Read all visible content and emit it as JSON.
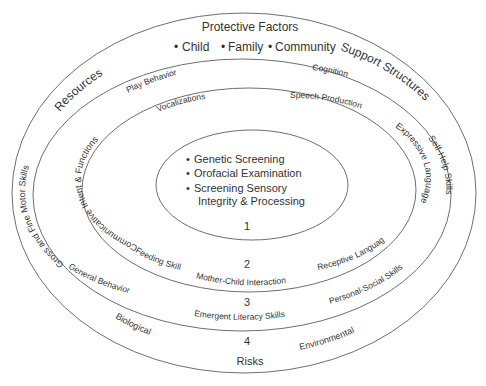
{
  "diagram": {
    "title": "Protective Factors",
    "protective_factors": [
      "Child",
      "Family",
      "Community"
    ],
    "outer_labels": {
      "top_left": "Resources",
      "top_right": "Support Structures",
      "bottom_center": "Risks",
      "bottom_left": "Biological",
      "bottom_right": "Environmental"
    },
    "ring_numbers": [
      "1",
      "2",
      "3",
      "4"
    ],
    "core": {
      "items": [
        "Genetic Screening",
        "Orofacial Examination",
        "Screening Sensory",
        "Integrity & Processing"
      ]
    },
    "ring3_band": {
      "top_left": "Play Behavior",
      "top_right": "Cognition",
      "left": "Gross and Fine Motor Skills",
      "right": "Self-Help Skills",
      "bottom_left": "General Behavior",
      "bottom_right": "Personal-Social Skills",
      "bottom_center": "Emergent Literacy Skills"
    },
    "ring2_band": {
      "top_left": "Vocalizations",
      "top_right": "Speech Production",
      "left": "Communicative Intent & Functions",
      "right": "Expressive Language",
      "bottom_left": "Feeding Skills",
      "bottom_right": "Receptive Language",
      "bottom_center": "Mother-Child Interaction"
    },
    "colors": {
      "line": "#6e6e6e",
      "text": "#333333",
      "background": "#ffffff"
    }
  }
}
